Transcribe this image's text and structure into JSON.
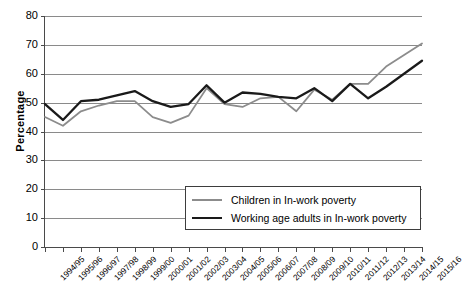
{
  "chart_data": {
    "type": "line",
    "title": "",
    "xlabel": "",
    "ylabel": "Percentage",
    "ylim": [
      0,
      80
    ],
    "yticks": [
      0,
      10,
      20,
      30,
      40,
      50,
      60,
      70,
      80
    ],
    "grid": "horizontal",
    "legend_position": "bottom-right-inside",
    "categories": [
      "1994/95",
      "1995/96",
      "1996/97",
      "1997/98",
      "1998/99",
      "1999/00",
      "2000/01",
      "2001/02",
      "2002/03",
      "2003/04",
      "2004/05",
      "2005/06",
      "2006/07",
      "2007/08",
      "2008/09",
      "2009/10",
      "2010/11",
      "2011/12",
      "2012/13",
      "2013/14",
      "2014/15",
      "2015/16"
    ],
    "series": [
      {
        "name": "Children in In-work poverty",
        "color": "#8c8c8c",
        "values": [
          45,
          42,
          47,
          49,
          50.5,
          50.5,
          45,
          43,
          45.5,
          55,
          49.5,
          48.5,
          51.5,
          52,
          47,
          54.5,
          51,
          56.5,
          56.5,
          62.5,
          66.5,
          70.5
        ]
      },
      {
        "name": "Working age adults in In-work poverty",
        "color": "#1a1a1a",
        "values": [
          49.5,
          44,
          50.5,
          51,
          52.5,
          54,
          50.5,
          48.5,
          49.5,
          56,
          50,
          53.5,
          53,
          52,
          51.5,
          55,
          50.5,
          56.5,
          51.5,
          55.5,
          60,
          64.5
        ]
      }
    ]
  },
  "axes": {
    "y_title": "Percentage"
  },
  "legend": {
    "items": [
      {
        "label": "Children in In-work poverty"
      },
      {
        "label": "Working age adults in In-work poverty"
      }
    ]
  },
  "caption": {
    "text": ""
  }
}
